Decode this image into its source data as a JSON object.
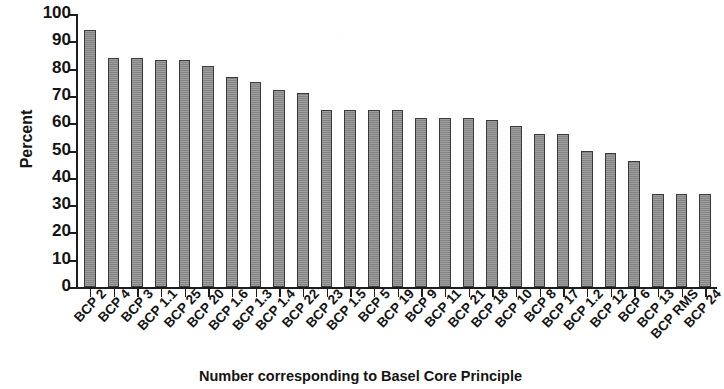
{
  "chart_data": {
    "type": "bar",
    "title": "",
    "xlabel": "Number corresponding to Basel Core Principle",
    "ylabel": "Percent",
    "ylim": [
      0,
      100
    ],
    "yticks": [
      0,
      10,
      20,
      30,
      40,
      50,
      60,
      70,
      80,
      90,
      100
    ],
    "grid": false,
    "legend": null,
    "bar_color": "#8c8c8c",
    "bar_edge_color": "#3a3a3a",
    "categories": [
      "BCP 2",
      "BCP 4",
      "BCP 3",
      "BCP 1.1",
      "BCP 25",
      "BCP 20",
      "BCP 1.6",
      "BCP 1.3",
      "BCP 1.4",
      "BCP 22",
      "BCP 23",
      "BCP 1.5",
      "BCP 5",
      "BCP 19",
      "BCP 9",
      "BCP 11",
      "BCP 21",
      "BCP 18",
      "BCP 10",
      "BCP 8",
      "BCP 17",
      "BCP 1.2",
      "BCP 12",
      "BCP 6",
      "BCP 13",
      "BCP RMS",
      "BCP 24"
    ],
    "values": [
      94,
      84,
      84,
      83,
      83,
      81,
      77,
      75,
      72,
      71,
      65,
      65,
      65,
      65,
      62,
      62,
      62,
      61,
      59,
      56,
      56,
      50,
      49,
      46,
      34,
      34,
      34
    ]
  }
}
